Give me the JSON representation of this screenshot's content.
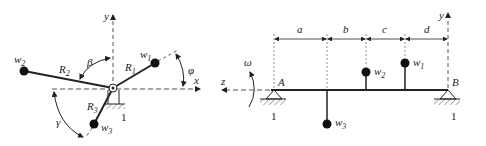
{
  "left_diagram": {
    "axes": {
      "x": "x",
      "y": "y"
    },
    "masses": [
      {
        "name": "w",
        "sub": "1",
        "radius_label": "R",
        "radius_sub": "1"
      },
      {
        "name": "w",
        "sub": "2",
        "radius_label": "R",
        "radius_sub": "2"
      },
      {
        "name": "w",
        "sub": "3",
        "radius_label": "R",
        "radius_sub": "3"
      }
    ],
    "angles": {
      "phi": "φ",
      "beta": "β",
      "gamma": "γ"
    },
    "support_label": "1"
  },
  "right_diagram": {
    "axes": {
      "y": "y",
      "z": "z"
    },
    "rotation": "ω",
    "bearings": {
      "left": "A",
      "right": "B",
      "left_num": "1",
      "right_num": "1"
    },
    "dimensions": [
      "a",
      "b",
      "c",
      "d"
    ],
    "masses": [
      {
        "name": "w",
        "sub": "1"
      },
      {
        "name": "w",
        "sub": "2"
      },
      {
        "name": "w",
        "sub": "3"
      }
    ]
  },
  "colors": {
    "line": "#222222",
    "dashed": "#555555",
    "hatch": "#777777"
  }
}
